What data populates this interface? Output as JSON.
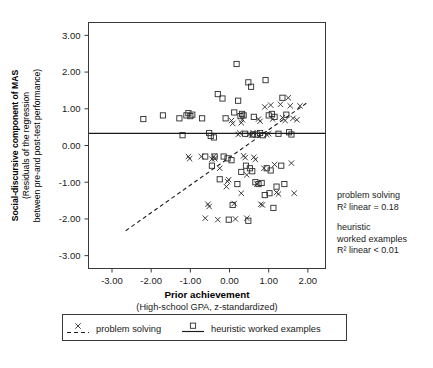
{
  "chart_data": {
    "type": "scatter",
    "title": "",
    "xlabel": "Prior achievement",
    "xlabel_sub": "(High-school GPA, z-standardized)",
    "ylabel_lines": [
      "Social-discursive component of MAS",
      "(Residuals of the regression",
      "between pre-and post-test performance)"
    ],
    "xlim": [
      -3.6,
      2.45
    ],
    "ylim": [
      -3.35,
      3.35
    ],
    "xticks": [
      "-3.00",
      "-2.00",
      "-1.00",
      "0.00",
      "1.00",
      "2.00"
    ],
    "xtick_values": [
      -3,
      -2,
      -1,
      0,
      1,
      2
    ],
    "yticks": [
      "3.00",
      "2.00",
      "1.00",
      "0.00",
      "-1.00",
      "-2.00",
      "-3.00"
    ],
    "ytick_values": [
      3,
      2,
      1,
      0,
      -1,
      -2,
      -3
    ],
    "grid": false,
    "legend_position": "below-plot",
    "series": [
      {
        "name": "problem solving",
        "marker": "x",
        "line_style": "dashed",
        "fit_line": {
          "x": [
            -2.65,
            2.0
          ],
          "y": [
            -2.32,
            1.18
          ]
        },
        "points": [
          [
            -1.05,
            -0.3
          ],
          [
            -1.02,
            -0.36
          ],
          [
            -0.72,
            -0.3
          ],
          [
            -0.45,
            -0.37
          ],
          [
            -0.4,
            -0.3
          ],
          [
            -0.38,
            -0.36
          ],
          [
            -0.05,
            -0.98
          ],
          [
            -0.02,
            -0.93
          ],
          [
            0.3,
            0.62
          ],
          [
            0.33,
            0.7
          ],
          [
            0.36,
            -0.28
          ],
          [
            0.4,
            -0.33
          ],
          [
            0.44,
            -0.8
          ],
          [
            0.5,
            0.3
          ],
          [
            0.56,
            0.28
          ],
          [
            0.6,
            0.35
          ],
          [
            0.62,
            -0.32
          ],
          [
            0.66,
            -0.38
          ],
          [
            0.7,
            -1.05
          ],
          [
            0.74,
            0.72
          ],
          [
            0.78,
            0.66
          ],
          [
            0.8,
            -1.6
          ],
          [
            0.84,
            -1.62
          ],
          [
            0.88,
            -0.62
          ],
          [
            0.9,
            1.05
          ],
          [
            0.95,
            0.3
          ],
          [
            1.0,
            0.32
          ],
          [
            1.05,
            1.1
          ],
          [
            1.1,
            0.72
          ],
          [
            1.15,
            -0.52
          ],
          [
            1.2,
            -1.28
          ],
          [
            1.25,
            -1.32
          ],
          [
            1.3,
            1.12
          ],
          [
            1.35,
            0.76
          ],
          [
            1.42,
            0.68
          ],
          [
            1.5,
            1.3
          ],
          [
            1.55,
            1.08
          ],
          [
            1.62,
            0.74
          ],
          [
            0.05,
            0.68
          ],
          [
            0.08,
            0.6
          ],
          [
            -0.62,
            -1.98
          ],
          [
            -0.3,
            -2.02
          ],
          [
            0.15,
            -2.0
          ],
          [
            0.44,
            -1.98
          ],
          [
            -0.55,
            -1.6
          ],
          [
            -0.52,
            -1.66
          ],
          [
            0.12,
            -1.58
          ],
          [
            -0.08,
            -1.12
          ],
          [
            1.72,
            0.7
          ],
          [
            1.8,
            1.08
          ],
          [
            0.22,
            0.3
          ],
          [
            0.26,
            0.34
          ],
          [
            1.58,
            -0.48
          ],
          [
            1.65,
            -1.3
          ],
          [
            0.3,
            -1.3
          ],
          [
            -0.25,
            -0.62
          ]
        ]
      },
      {
        "name": "heuristic worked examples",
        "marker": "square",
        "line_style": "solid",
        "fit_line": {
          "x": [
            -3.6,
            2.45
          ],
          "y": [
            0.33,
            0.33
          ]
        },
        "points": [
          [
            -2.2,
            0.72
          ],
          [
            -1.7,
            0.82
          ],
          [
            -1.28,
            0.74
          ],
          [
            -1.1,
            0.82
          ],
          [
            -1.05,
            0.88
          ],
          [
            -1.0,
            0.8
          ],
          [
            -0.95,
            0.84
          ],
          [
            -0.7,
            0.74
          ],
          [
            -1.2,
            0.28
          ],
          [
            -0.52,
            0.34
          ],
          [
            -0.48,
            0.26
          ],
          [
            -0.4,
            0.22
          ],
          [
            -0.45,
            -0.55
          ],
          [
            -0.3,
            1.4
          ],
          [
            -0.18,
            1.28
          ],
          [
            -0.1,
            0.74
          ],
          [
            0.12,
            0.9
          ],
          [
            0.18,
            2.22
          ],
          [
            0.22,
            1.22
          ],
          [
            0.28,
            0.8
          ],
          [
            0.32,
            0.86
          ],
          [
            0.36,
            0.82
          ],
          [
            0.4,
            0.32
          ],
          [
            0.48,
            1.72
          ],
          [
            0.55,
            1.6
          ],
          [
            0.62,
            0.78
          ],
          [
            0.7,
            0.3
          ],
          [
            0.78,
            0.34
          ],
          [
            0.85,
            0.28
          ],
          [
            0.92,
            1.78
          ],
          [
            1.0,
            0.82
          ],
          [
            1.08,
            0.86
          ],
          [
            1.15,
            0.78
          ],
          [
            1.25,
            0.32
          ],
          [
            1.35,
            1.3
          ],
          [
            1.45,
            0.84
          ],
          [
            1.52,
            0.36
          ],
          [
            -0.38,
            -0.3
          ],
          [
            -0.05,
            -0.35
          ],
          [
            0.05,
            -0.4
          ],
          [
            0.42,
            -0.55
          ],
          [
            0.52,
            -0.62
          ],
          [
            0.58,
            -0.7
          ],
          [
            0.66,
            -1.0
          ],
          [
            0.74,
            -1.05
          ],
          [
            0.82,
            -1.02
          ],
          [
            0.9,
            -1.35
          ],
          [
            1.02,
            -1.3
          ],
          [
            1.12,
            -1.7
          ],
          [
            1.2,
            -1.12
          ],
          [
            0.2,
            -1.05
          ],
          [
            0.08,
            -1.62
          ],
          [
            -0.02,
            -2.02
          ],
          [
            0.48,
            -2.05
          ],
          [
            1.32,
            -0.55
          ],
          [
            1.4,
            -1.05
          ],
          [
            -0.62,
            -0.3
          ],
          [
            -0.25,
            -0.92
          ],
          [
            0.6,
            0.3
          ],
          [
            1.58,
            0.3
          ],
          [
            0.95,
            -0.62
          ],
          [
            1.05,
            -0.68
          ],
          [
            0.3,
            -0.72
          ],
          [
            -0.15,
            -0.3
          ]
        ]
      }
    ],
    "annotations": [
      {
        "lines": [
          "problem solving",
          "R² linear = 0.18"
        ]
      },
      {
        "lines": [
          "heuristic",
          "worked examples",
          "R² linear < 0.01"
        ]
      }
    ],
    "legend": [
      {
        "label": "problem solving",
        "marker": "x",
        "line_style": "dashed"
      },
      {
        "label": "heuristic worked examples",
        "marker": "square",
        "line_style": "solid"
      }
    ]
  }
}
